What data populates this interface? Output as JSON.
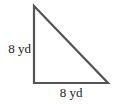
{
  "diagram": {
    "shape": "right-triangle",
    "stroke_color": "#555555",
    "vertices": [
      [
        34,
        6
      ],
      [
        34,
        83
      ],
      [
        108,
        83
      ]
    ],
    "labels": {
      "left_side": "8 yd",
      "bottom_side": "8 yd"
    }
  }
}
